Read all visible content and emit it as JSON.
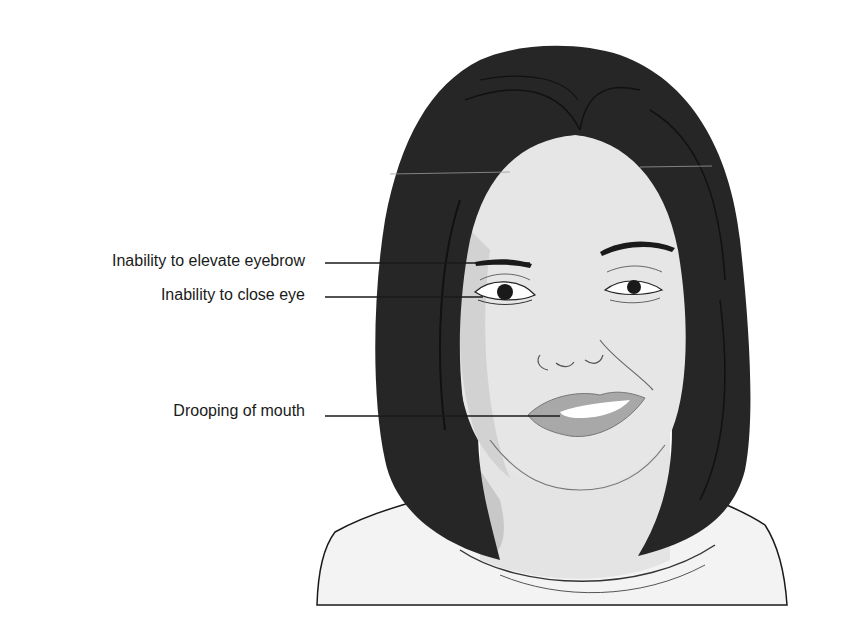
{
  "figure": {
    "colors": {
      "hair": "#262626",
      "skin": "#e6e6e6",
      "skin_shadow": "#c9c9c9",
      "lips": "#a8a8a8",
      "clothing": "#f2f2f2",
      "line": "#1a1a1a"
    }
  },
  "annotations": [
    {
      "id": "eyebrow",
      "label": "Inability to elevate eyebrow"
    },
    {
      "id": "eye",
      "label": "Inability to close eye"
    },
    {
      "id": "mouth",
      "label": "Drooping of mouth"
    }
  ]
}
